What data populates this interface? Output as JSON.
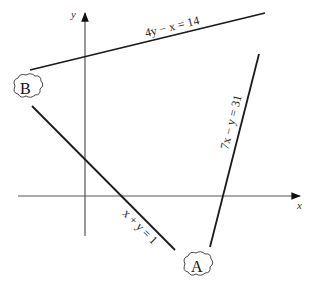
{
  "axes": {
    "x_label": "x",
    "y_label": "y"
  },
  "lines": [
    {
      "id": "line1",
      "equation": "4y − x = 14"
    },
    {
      "id": "line2",
      "equation": "x + y = 1"
    },
    {
      "id": "line3",
      "equation": "7x − y = 31"
    }
  ],
  "points": [
    {
      "id": "A",
      "label": "A"
    },
    {
      "id": "B",
      "label": "B"
    }
  ],
  "colors": {
    "line": "#1a1a1a",
    "axis": "#555555",
    "background": "#ffffff"
  }
}
